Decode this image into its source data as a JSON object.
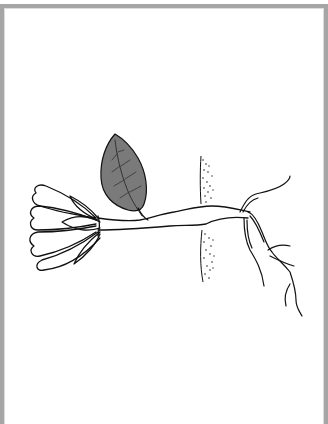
{
  "illustration": {
    "subject": "plant cutting rooting through a barrier",
    "caption": "",
    "parts": [
      {
        "name": "flower",
        "description": "white multi-petal flower with sepals, outline only"
      },
      {
        "name": "leaf",
        "description": "single ovate leaf shaded gray with veins"
      },
      {
        "name": "stem",
        "description": "horizontal stem running left to right"
      },
      {
        "name": "barrier",
        "description": "vertical stippled strip (soil/bark layer) crossed by stem"
      },
      {
        "name": "roots",
        "description": "branching roots on right side descending downward"
      }
    ],
    "colors": {
      "frame": "#a6a6a6",
      "background": "#ffffff",
      "line": "#111111",
      "leaf_fill": "#7a7a7a"
    }
  }
}
